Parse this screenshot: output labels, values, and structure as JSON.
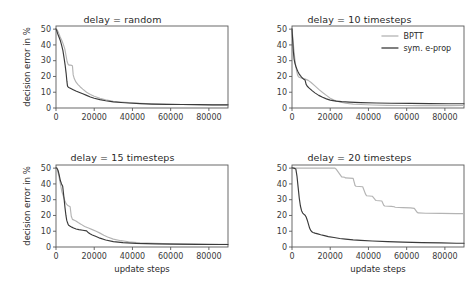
{
  "figure": {
    "panel_titles": [
      "delay = random",
      "delay = 10 timesteps",
      "delay = 15 timesteps",
      "delay = 20 timesteps"
    ],
    "legend": {
      "entries": [
        {
          "label": "BPTT",
          "color": "#b4b4b4"
        },
        {
          "label": "sym. e-prop",
          "color": "#3a3a3a"
        }
      ],
      "position": "top-right of panel 2"
    }
  },
  "chart_data": [
    {
      "type": "line",
      "title": "delay = random",
      "xlabel": "",
      "ylabel": "decision error in %",
      "xlim": [
        0,
        90000
      ],
      "ylim": [
        0,
        52
      ],
      "xticks": [
        0,
        20000,
        40000,
        60000,
        80000
      ],
      "xtick_labels": [
        "0",
        "20000",
        "40000",
        "60000",
        "80000"
      ],
      "yticks": [
        0,
        10,
        20,
        30,
        40,
        50
      ],
      "ytick_labels": [
        "0",
        "10",
        "20",
        "30",
        "40",
        "50"
      ],
      "grid": false,
      "series": [
        {
          "name": "BPTT",
          "color": "#b4b4b4",
          "x": [
            0,
            600,
            1400,
            2200,
            3000,
            3800,
            4600,
            5200,
            5800,
            6400,
            7000,
            7600,
            8200,
            8600,
            9000,
            9600,
            10400,
            11400,
            12600,
            14000,
            16000,
            18000,
            20000,
            23000,
            26000,
            30000,
            34000,
            38000,
            44000,
            50000,
            58000,
            66000,
            74000,
            82000,
            90000
          ],
          "y": [
            50.0,
            49.6,
            47.5,
            45.0,
            43.0,
            40.5,
            37.5,
            33.5,
            29.5,
            27.5,
            27.2,
            27.2,
            27.0,
            26.8,
            21.0,
            18.5,
            16.5,
            15.0,
            13.5,
            12.0,
            10.0,
            8.6,
            7.5,
            6.2,
            5.2,
            4.3,
            3.8,
            3.4,
            3.0,
            2.7,
            2.4,
            2.2,
            2.1,
            2.0,
            2.0
          ]
        },
        {
          "name": "sym. e-prop",
          "color": "#3a3a3a",
          "x": [
            0,
            400,
            900,
            1500,
            2200,
            2900,
            3600,
            4200,
            4800,
            5300,
            5700,
            6000,
            6300,
            6700,
            7200,
            8000,
            9000,
            10400,
            12000,
            14000,
            16000,
            18000,
            20000,
            23000,
            26000,
            30000,
            34000,
            38000,
            44000,
            50000,
            58000,
            66000,
            74000,
            82000,
            90000
          ],
          "y": [
            50.2,
            49.0,
            47.0,
            45.2,
            43.0,
            40.0,
            36.5,
            32.0,
            27.0,
            22.0,
            17.0,
            14.0,
            13.4,
            13.0,
            12.7,
            12.2,
            11.6,
            10.8,
            10.0,
            9.0,
            8.0,
            7.0,
            6.2,
            5.3,
            4.6,
            3.9,
            3.5,
            3.2,
            2.8,
            2.5,
            2.3,
            2.2,
            2.1,
            2.0,
            2.0
          ]
        }
      ]
    },
    {
      "type": "line",
      "title": "delay = 10 timesteps",
      "xlabel": "",
      "ylabel": "",
      "xlim": [
        0,
        90000
      ],
      "ylim": [
        0,
        52
      ],
      "xticks": [
        0,
        20000,
        40000,
        60000,
        80000
      ],
      "xtick_labels": [
        "0",
        "20000",
        "40000",
        "60000",
        "80000"
      ],
      "yticks": [
        0,
        10,
        20,
        30,
        40,
        50
      ],
      "ytick_labels": [
        "0",
        "10",
        "20",
        "30",
        "40",
        "50"
      ],
      "grid": false,
      "series": [
        {
          "name": "BPTT",
          "color": "#b4b4b4",
          "x": [
            0,
            400,
            900,
            1400,
            1900,
            2400,
            2900,
            3400,
            4000,
            4800,
            5800,
            7000,
            8500,
            10000,
            12000,
            14000,
            16000,
            18000,
            20000,
            22000,
            25000,
            28000,
            32000,
            36000,
            42000,
            50000,
            58000,
            66000,
            74000,
            82000,
            90000
          ],
          "y": [
            50.0,
            45.0,
            38.0,
            32.0,
            27.0,
            23.5,
            21.0,
            19.8,
            19.3,
            19.0,
            18.8,
            18.3,
            17.5,
            16.2,
            14.0,
            11.8,
            9.8,
            8.0,
            6.2,
            5.0,
            3.8,
            3.0,
            2.5,
            2.2,
            1.9,
            1.7,
            1.6,
            1.5,
            1.5,
            1.5,
            1.6
          ]
        },
        {
          "name": "sym. e-prop",
          "color": "#3a3a3a",
          "x": [
            0,
            300,
            700,
            1100,
            1500,
            2000,
            2600,
            3200,
            3800,
            4400,
            5000,
            5600,
            6200,
            6800,
            7400,
            8000,
            9000,
            10500,
            12000,
            14000,
            16000,
            18000,
            20000,
            23000,
            26000,
            30000,
            36000,
            44000,
            52000,
            62000,
            72000,
            82000,
            90000
          ],
          "y": [
            50.2,
            44.0,
            36.0,
            31.0,
            28.5,
            26.5,
            24.5,
            22.8,
            21.5,
            20.5,
            19.6,
            18.8,
            18.2,
            17.8,
            15.0,
            13.8,
            12.6,
            11.0,
            9.6,
            8.0,
            6.8,
            5.8,
            5.0,
            4.4,
            4.0,
            3.7,
            3.4,
            3.2,
            3.0,
            2.9,
            2.8,
            2.7,
            2.7
          ]
        }
      ]
    },
    {
      "type": "line",
      "title": "delay = 15 timesteps",
      "xlabel": "update steps",
      "ylabel": "decision error in %",
      "xlim": [
        0,
        90000
      ],
      "ylim": [
        0,
        52
      ],
      "xticks": [
        0,
        20000,
        40000,
        60000,
        80000
      ],
      "xtick_labels": [
        "0",
        "20000",
        "40000",
        "60000",
        "80000"
      ],
      "yticks": [
        0,
        10,
        20,
        30,
        40,
        50
      ],
      "ytick_labels": [
        "0",
        "10",
        "20",
        "30",
        "40",
        "50"
      ],
      "grid": false,
      "series": [
        {
          "name": "BPTT",
          "color": "#b4b4b4",
          "x": [
            0,
            700,
            1500,
            2300,
            3100,
            3900,
            4600,
            5300,
            6000,
            6700,
            7400,
            8000,
            8600,
            9200,
            9600,
            10400,
            11600,
            13000,
            15000,
            17000,
            19000,
            21000,
            23000,
            25000,
            27000,
            30000,
            34000,
            38000,
            44000,
            52000,
            60000,
            70000,
            80000,
            90000
          ],
          "y": [
            50.0,
            49.0,
            45.0,
            40.0,
            35.0,
            32.0,
            29.5,
            27.5,
            26.5,
            26.0,
            25.5,
            19.5,
            17.5,
            17.2,
            17.0,
            16.5,
            15.5,
            14.5,
            13.0,
            12.0,
            11.0,
            10.0,
            8.8,
            7.5,
            6.3,
            5.0,
            4.0,
            3.3,
            2.7,
            2.3,
            2.0,
            1.8,
            1.7,
            1.7
          ]
        },
        {
          "name": "sym. e-prop",
          "color": "#3a3a3a",
          "x": [
            0,
            500,
            1100,
            1700,
            2300,
            2900,
            3500,
            4100,
            4700,
            5200,
            5600,
            6000,
            6400,
            6800,
            7400,
            8200,
            9200,
            10500,
            12000,
            14000,
            16000,
            17000,
            18000,
            19000,
            21000,
            23000,
            26000,
            30000,
            35000,
            42000,
            52000,
            62000,
            74000,
            86000,
            90000
          ],
          "y": [
            50.2,
            50.0,
            48.5,
            45.5,
            42.0,
            40.0,
            38.5,
            32.0,
            25.0,
            20.0,
            17.0,
            15.5,
            14.2,
            13.6,
            13.2,
            12.6,
            12.0,
            11.4,
            11.0,
            10.6,
            10.2,
            9.0,
            8.2,
            7.6,
            6.6,
            5.6,
            4.4,
            3.4,
            2.8,
            2.3,
            2.0,
            1.8,
            1.7,
            1.6,
            1.6
          ]
        }
      ]
    },
    {
      "type": "line",
      "title": "delay = 20 timesteps",
      "xlabel": "update steps",
      "ylabel": "",
      "xlim": [
        0,
        90000
      ],
      "ylim": [
        0,
        52
      ],
      "xticks": [
        0,
        20000,
        40000,
        60000,
        80000
      ],
      "xtick_labels": [
        "0",
        "20000",
        "40000",
        "60000",
        "80000"
      ],
      "yticks": [
        0,
        10,
        20,
        30,
        40,
        50
      ],
      "ytick_labels": [
        "0",
        "10",
        "20",
        "30",
        "40",
        "50"
      ],
      "grid": false,
      "series": [
        {
          "name": "BPTT",
          "color": "#b4b4b4",
          "x": [
            0,
            5000,
            12000,
            20000,
            22500,
            23000,
            26000,
            27500,
            28000,
            32000,
            33000,
            33500,
            37000,
            38500,
            39000,
            42000,
            43500,
            44000,
            47000,
            48000,
            48500,
            52000,
            53500,
            54000,
            58000,
            62000,
            64000,
            65500,
            66000,
            70000,
            78000,
            86000,
            90000
          ],
          "y": [
            50.0,
            50.0,
            50.0,
            50.0,
            50.0,
            49.5,
            44.5,
            44.2,
            43.8,
            43.5,
            39.0,
            38.5,
            38.2,
            33.5,
            32.5,
            32.2,
            30.0,
            29.5,
            29.2,
            26.5,
            26.0,
            25.8,
            25.5,
            25.2,
            25.0,
            24.8,
            24.5,
            22.0,
            21.6,
            21.4,
            21.3,
            21.2,
            21.2
          ]
        },
        {
          "name": "sym. e-prop",
          "color": "#3a3a3a",
          "x": [
            0,
            1000,
            2000,
            2600,
            3200,
            3800,
            4400,
            5000,
            5600,
            6200,
            6800,
            7400,
            8000,
            8600,
            9200,
            9800,
            10400,
            11000,
            12000,
            13500,
            15000,
            17000,
            19000,
            22000,
            25000,
            28000,
            32000,
            36000,
            42000,
            50000,
            58000,
            68000,
            78000,
            86000,
            90000
          ],
          "y": [
            50.2,
            50.0,
            49.5,
            45.0,
            38.0,
            31.0,
            26.0,
            23.0,
            21.5,
            20.8,
            20.2,
            19.0,
            17.0,
            14.5,
            12.0,
            10.5,
            9.6,
            9.2,
            8.8,
            8.3,
            7.8,
            7.2,
            6.6,
            6.0,
            5.4,
            5.0,
            4.5,
            4.2,
            3.8,
            3.4,
            3.1,
            2.8,
            2.6,
            2.4,
            2.4
          ]
        }
      ]
    }
  ]
}
